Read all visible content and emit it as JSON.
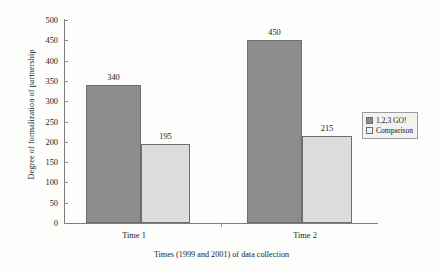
{
  "chart_data": {
    "type": "bar",
    "title": "",
    "xlabel": "Times (1999 and 2001) of data collection",
    "ylabel": "Degree of formalization of partnership",
    "categories": [
      "Time 1",
      "Time 2"
    ],
    "series": [
      {
        "name": "1,2,3 GO!",
        "values": [
          340,
          450
        ],
        "color": "#8d8d8d"
      },
      {
        "name": "Comparison",
        "values": [
          195,
          215
        ],
        "color": "#dcdcdc"
      }
    ],
    "ylim": [
      0,
      500
    ],
    "yticks": [
      0,
      50,
      100,
      150,
      200,
      250,
      300,
      350,
      400,
      450,
      500
    ],
    "ytick_labels": [
      "0",
      "50",
      "100",
      "150",
      "200",
      "250",
      "300",
      "350",
      "400",
      "450",
      "500"
    ],
    "data_labels": [
      "340",
      "195",
      "450",
      "215"
    ],
    "grid": false,
    "legend_position": "right"
  },
  "legend": {
    "entries": [
      {
        "label": "1,2,3 GO!",
        "swatch": "filled-dark-square-icon"
      },
      {
        "label": "Comparison",
        "swatch": "empty-light-square-icon"
      }
    ]
  }
}
